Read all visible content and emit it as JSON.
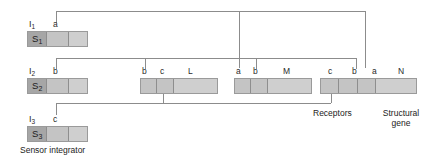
{
  "diagram": {
    "stroke_color": "#8c8c8c",
    "block_fill": "#c9c9c9",
    "sensor_fill": "#a6a6a6",
    "text_color": "#2a2a2a"
  },
  "integrators": [
    {
      "id": "i1",
      "label": "I",
      "sub": "1",
      "code": "S",
      "code_sub": "1",
      "site": "a"
    },
    {
      "id": "i2",
      "label": "I",
      "sub": "2",
      "code": "S",
      "code_sub": "2",
      "site": "b"
    },
    {
      "id": "i3",
      "label": "I",
      "sub": "3",
      "code": "S",
      "code_sub": "3",
      "site": "c"
    }
  ],
  "receptor_blocks": [
    {
      "id": "bcl",
      "sites": [
        "b",
        "c"
      ],
      "gene": "L"
    },
    {
      "id": "abm",
      "sites": [
        "a",
        "b"
      ],
      "gene": "M"
    },
    {
      "id": "cban",
      "sites": [
        "c",
        "b",
        "a"
      ],
      "gene": "N"
    }
  ],
  "captions": {
    "sensor_integrator": "Sensor integrator",
    "receptors": "Receptors",
    "structural_gene": "Structural\ngene",
    "structural_gene_line1": "Structural",
    "structural_gene_line2": "gene"
  },
  "site_labels": {
    "i1_a": "a",
    "i2_b": "b",
    "i3_c": "c",
    "bcl_b": "b",
    "bcl_c": "c",
    "bcl_L": "L",
    "abm_a": "a",
    "abm_b": "b",
    "abm_M": "M",
    "cban_c": "c",
    "cban_b": "b",
    "cban_a": "a",
    "cban_N": "N"
  }
}
